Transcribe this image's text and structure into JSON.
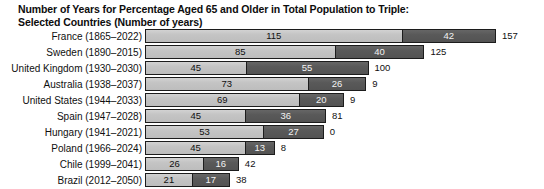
{
  "chart_data": {
    "type": "bar",
    "subtype": "stacked-horizontal",
    "title": "Number of Years for Percentage Aged 65 and Older in Total Population to Triple: Selected Countries (Number of years)",
    "title_lines": [
      "Number of Years for Percentage Aged 65 and Older in Total Population to Triple:",
      "Selected Countries (Number of years)"
    ],
    "xlabel": "",
    "ylabel": "",
    "grid": false,
    "legend": "none",
    "axis_visible": false,
    "xlim": [
      0,
      157
    ],
    "units": "years",
    "px_per_unit": 2.235,
    "colors": {
      "segment_first": "#c6c6c6",
      "segment_second": "#5b5b5b",
      "bar_border": "#1c1c1c",
      "text": "#101010",
      "segment_second_text": "#f2f2f2",
      "background": "#ffffff"
    },
    "categories": [
      "France (1865–2022)",
      "Sweden (1890–2015)",
      "United Kingdom (1930–2030)",
      "Australia (1938–2037)",
      "United States (1944–2033)",
      "Spain (1947–2028)",
      "Hungary (1941–2021)",
      "Poland (1966–2024)",
      "Chile (1999–2041)",
      "Brazil (2012–2050)"
    ],
    "series": [
      {
        "name": "first segment",
        "values": [
          115,
          85,
          45,
          73,
          69,
          45,
          53,
          45,
          26,
          21
        ]
      },
      {
        "name": "second segment",
        "values": [
          42,
          40,
          55,
          26,
          20,
          36,
          27,
          13,
          16,
          17
        ]
      }
    ],
    "totals": [
      157,
      125,
      100,
      99,
      89,
      81,
      80,
      58,
      42,
      38
    ],
    "rows": [
      {
        "label": "France (1865–2022)",
        "country": "France",
        "period": "1865–2022",
        "first": 115,
        "second": 42,
        "total": 157,
        "first_text": "115",
        "second_text": "42",
        "total_text": "157"
      },
      {
        "label": "Sweden (1890–2015)",
        "country": "Sweden",
        "period": "1890–2015",
        "first": 85,
        "second": 40,
        "total": 125,
        "first_text": "85",
        "second_text": "40",
        "total_text": "125"
      },
      {
        "label": "United Kingdom (1930–2030)",
        "country": "United Kingdom",
        "period": "1930–2030",
        "first": 45,
        "second": 55,
        "total": 100,
        "first_text": "45",
        "second_text": "55",
        "total_text": "100"
      },
      {
        "label": "Australia (1938–2037)",
        "country": "Australia",
        "period": "1938–2037",
        "first": 73,
        "second": 26,
        "total": 99,
        "first_text": "73",
        "second_text": "26",
        "total_text": "9"
      },
      {
        "label": "United States (1944–2033)",
        "country": "United States",
        "period": "1944–2033",
        "first": 69,
        "second": 20,
        "total": 89,
        "first_text": "69",
        "second_text": "20",
        "total_text": "9"
      },
      {
        "label": "Spain (1947–2028)",
        "country": "Spain",
        "period": "1947–2028",
        "first": 45,
        "second": 36,
        "total": 81,
        "first_text": "45",
        "second_text": "36",
        "total_text": "81"
      },
      {
        "label": "Hungary (1941–2021)",
        "country": "Hungary",
        "period": "1941–2021",
        "first": 53,
        "second": 27,
        "total": 80,
        "first_text": "53",
        "second_text": "27",
        "total_text": "0"
      },
      {
        "label": "Poland (1966–2024)",
        "country": "Poland",
        "period": "1966–2024",
        "first": 45,
        "second": 13,
        "total": 58,
        "first_text": "45",
        "second_text": "13",
        "total_text": "8"
      },
      {
        "label": "Chile (1999–2041)",
        "country": "Chile",
        "period": "1999–2041",
        "first": 26,
        "second": 16,
        "total": 42,
        "first_text": "26",
        "second_text": "16",
        "total_text": "42"
      },
      {
        "label": "Brazil (2012–2050)",
        "country": "Brazil",
        "period": "2012–2050",
        "first": 21,
        "second": 17,
        "total": 38,
        "first_text": "21",
        "second_text": "17",
        "total_text": "38"
      }
    ]
  }
}
